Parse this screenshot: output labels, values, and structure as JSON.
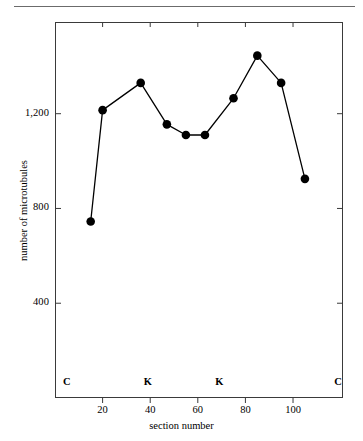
{
  "chart_data": {
    "type": "line",
    "title": "",
    "xlabel": "section number",
    "ylabel": "number of microtubules",
    "xlim": [
      0,
      121
    ],
    "ylim": [
      0,
      1587
    ],
    "grid": false,
    "legend": null,
    "marker": "filled-circle",
    "x": [
      15,
      20,
      36,
      47,
      55,
      63,
      75,
      85,
      95,
      105
    ],
    "y": [
      745,
      1215,
      1330,
      1155,
      1110,
      1110,
      1265,
      1445,
      1330,
      925
    ],
    "xticks": [
      20,
      40,
      60,
      80,
      100
    ],
    "xtick_labels": [
      "20",
      "40",
      "60",
      "80",
      "100"
    ],
    "yticks": [
      400,
      800,
      1200
    ],
    "ytick_labels": [
      "400",
      "800",
      "1,200"
    ],
    "annotations": [
      {
        "text": "C",
        "x": 5,
        "y_px": 383
      },
      {
        "text": "K",
        "x": 39,
        "y_px": 383
      },
      {
        "text": "K",
        "x": 69,
        "y_px": 383
      },
      {
        "text": "C",
        "x": 119,
        "y_px": 383
      }
    ],
    "line_color": "#000000",
    "marker_color": "#000000",
    "axis_color": "#3a3a3a"
  }
}
